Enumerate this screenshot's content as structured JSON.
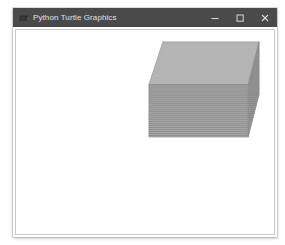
{
  "window": {
    "title": "Python Turtle Graphics",
    "icon": "turtle-icon",
    "controls": {
      "minimize_label": "─",
      "maximize_label": "☐",
      "close_label": "✕"
    },
    "titlebar_color": "#4a4a4a",
    "titlebar_text_color": "#e2e2e2",
    "canvas_background": "#ffffff",
    "canvas_border_color": "#c8c8c8"
  },
  "drawing": {
    "name": "3d-box",
    "description": "Striped 3D cuboid drawn with turtle graphics",
    "top_face_color": "#b4b4b4",
    "front_face_color": "#a8a8a8",
    "front_face_stripe_color": "#8e8e8e",
    "side_face_color": "#9a9a9a",
    "side_face_stripe_color": "#868686",
    "outline_color": "#8c8c8c",
    "stripe_count": 26,
    "geometry": {
      "front_top_left": [
        134,
        55
      ],
      "front_top_right": [
        234,
        55
      ],
      "front_bottom_left": [
        134,
        108
      ],
      "front_bottom_right": [
        234,
        108
      ],
      "top_back_left": [
        148,
        12
      ],
      "top_back_right": [
        245,
        12
      ],
      "side_bottom_right": [
        245,
        65
      ]
    }
  }
}
